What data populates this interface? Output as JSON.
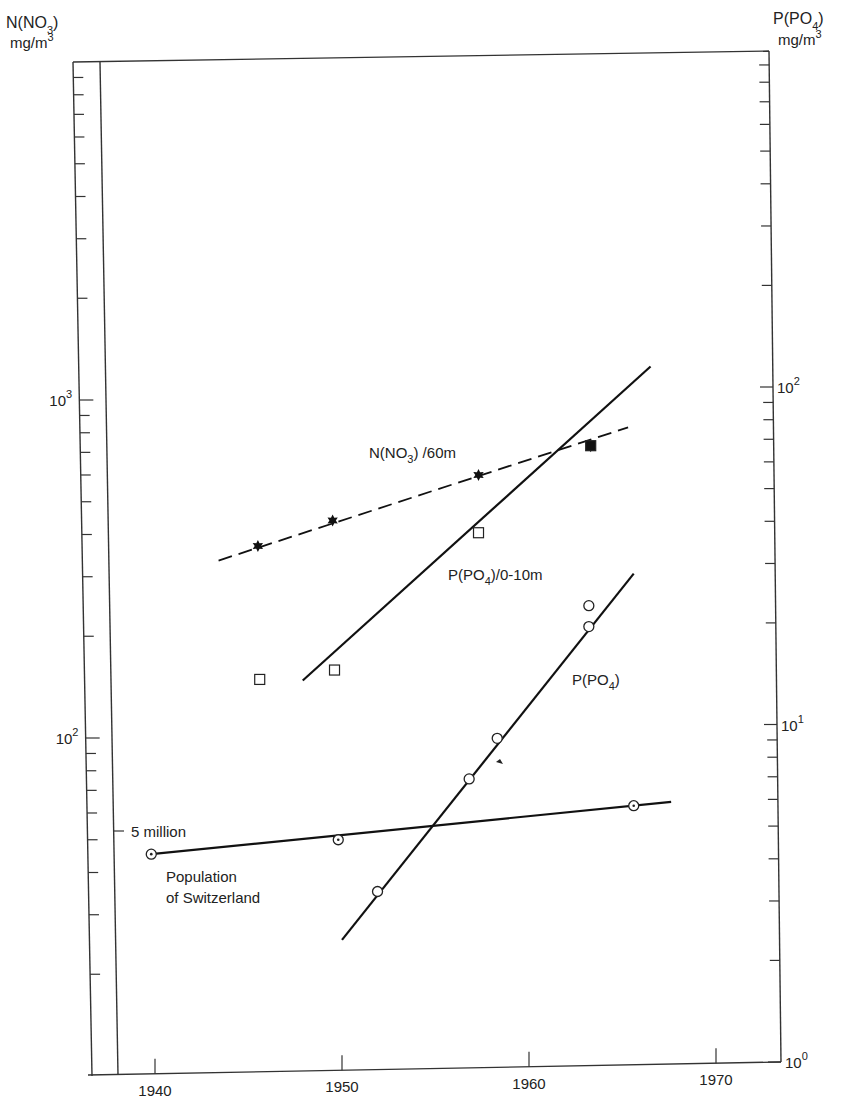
{
  "chart_data": {
    "type": "scatter",
    "title": "",
    "xlabel": "",
    "x_ticks": [
      "1940",
      "1950",
      "1960",
      "1970"
    ],
    "xlim": [
      1936.5,
      1973.5
    ],
    "left_axis": {
      "label_line1": "N(NO",
      "label_sub": "3",
      "label_close": ")",
      "label_line2": "mg/m",
      "label_sup": "3",
      "scale": "log",
      "ylim": [
        15,
        8000
      ],
      "ticks": [
        {
          "base": "10",
          "exp": "3",
          "value": 1000
        },
        {
          "base": "10",
          "exp": "2",
          "value": 100
        }
      ]
    },
    "right_axis": {
      "label_line1": "P(PO",
      "label_sub": "4",
      "label_close": ")",
      "label_line2": "mg/m",
      "label_sup": "3",
      "scale": "log",
      "ylim": [
        1,
        1000
      ],
      "ticks": [
        {
          "base": "10",
          "exp": "2",
          "value": 100
        },
        {
          "base": "10",
          "exp": "1",
          "value": 10
        },
        {
          "base": "10",
          "exp": "0",
          "value": 1
        }
      ]
    },
    "population_axis": {
      "tick_label": "5 million",
      "tick_value_millions": 5
    },
    "series": [
      {
        "name": "N(NO3) /60m",
        "label_main": "N(NO",
        "label_sub": "3",
        "label_tail": ") /60m",
        "axis": "left",
        "marker": "star",
        "line": "dashed",
        "x": [
          1945.5,
          1949.5,
          1957.3,
          1963.3
        ],
        "y": [
          370,
          440,
          600,
          730
        ],
        "fit": {
          "x": [
            1943.4,
            1965.3
          ],
          "y": [
            335,
            830
          ]
        }
      },
      {
        "name": "P(PO4)/0-10m",
        "label_main": "P(PO",
        "label_sub": "4",
        "label_tail": ")/0-10m",
        "axis": "right",
        "marker": "open-square",
        "line": "solid",
        "x": [
          1945.6,
          1949.6,
          1957.3,
          1963.3
        ],
        "y": [
          13.6,
          14.5,
          37,
          67
        ],
        "filled": [
          false,
          false,
          false,
          true
        ],
        "fit": {
          "x": [
            1947.9,
            1966.5
          ],
          "y": [
            13.5,
            115
          ]
        }
      },
      {
        "name": "P(PO4)",
        "label_main": "P(PO",
        "label_sub": "4",
        "label_tail": ")",
        "axis": "right",
        "marker": "open-circle",
        "line": "solid",
        "x": [
          1951.9,
          1956.8,
          1958.3,
          1963.2,
          1963.2
        ],
        "y": [
          3.2,
          6.9,
          9.1,
          19.5,
          22.5
        ],
        "fit": {
          "x": [
            1950.0,
            1965.6
          ],
          "y": [
            2.3,
            28
          ]
        }
      },
      {
        "name": "Population of Switzerland",
        "label_line1": "Population",
        "label_line2": "of Switzerland",
        "axis": "population",
        "marker": "dotted-circle",
        "line": "solid",
        "x": [
          1939.8,
          1949.8,
          1965.6
        ],
        "y_millions": [
          4.27,
          4.71,
          5.94
        ],
        "fit": {
          "x": [
            1939.8,
            1967.6
          ],
          "y_millions": [
            4.27,
            6.1
          ]
        }
      }
    ],
    "annotations": [
      "arrow mark near P(PO4) point at 1958"
    ],
    "grid": false,
    "legend": "none (inline labels)"
  }
}
